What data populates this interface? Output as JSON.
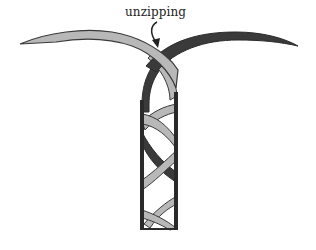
{
  "figure": {
    "type": "DNA double helix unzipping schematic",
    "annotation": {
      "label": "unzipping",
      "arrow": "curved arrow pointing down toward the fork"
    },
    "strands": [
      {
        "name": "light strand",
        "color": "#b8b8b8",
        "outline": "#3a3a3a",
        "exits": "left"
      },
      {
        "name": "dark strand",
        "color": "#3a3a3a",
        "outline": "#2a2a2a",
        "exits": "right"
      }
    ],
    "helix_column": {
      "outline_color": "#2a2a2a",
      "background": "#ffffff"
    }
  }
}
